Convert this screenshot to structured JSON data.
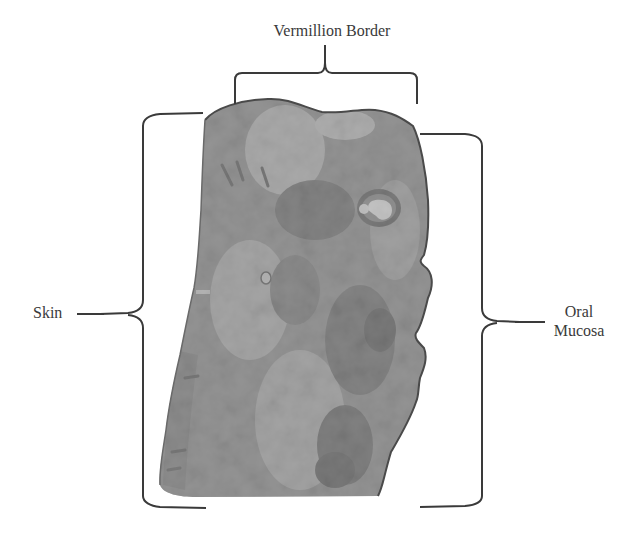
{
  "figure": {
    "type": "annotated histology diagram",
    "labels": {
      "top": "Vermillion Border",
      "left": "Skin",
      "right_line1": "Oral",
      "right_line2": "Mucosa"
    },
    "colors": {
      "background": "#ffffff",
      "bracket": "#3a3a3a",
      "text": "#3a3a3a",
      "tissue_base": "#8c8c8c",
      "tissue_dark": "#5e5e5e",
      "tissue_light": "#c4c4c4",
      "tissue_edge": "#4a4a4a"
    }
  }
}
